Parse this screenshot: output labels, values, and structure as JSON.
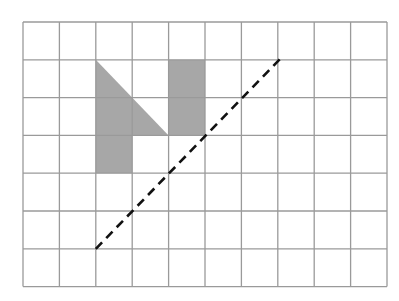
{
  "diagram": {
    "type": "grid-symmetry",
    "grid": {
      "columns": 10,
      "rows": 7,
      "origin_x": 23,
      "origin_y": 22,
      "cell_width": 36.4,
      "cell_height": 37.8,
      "line_color": "#9a9a9a",
      "line_width": 1.3
    },
    "shaded_color": "#a7a7a7",
    "shapes": [
      {
        "name": "triangle",
        "points": [
          [
            2,
            1
          ],
          [
            2,
            3
          ],
          [
            4,
            3
          ]
        ]
      },
      {
        "name": "square-below-triangle",
        "points": [
          [
            2,
            3
          ],
          [
            3,
            3
          ],
          [
            3,
            4
          ],
          [
            2,
            4
          ]
        ]
      },
      {
        "name": "rectangle-right",
        "points": [
          [
            4,
            1
          ],
          [
            5,
            1
          ],
          [
            5,
            3
          ],
          [
            4,
            3
          ]
        ]
      }
    ],
    "mirror_line": {
      "from": [
        2,
        6
      ],
      "to": [
        7.12,
        0.92
      ],
      "color": "#111111",
      "dash": "9,6",
      "width": 2.6
    }
  }
}
